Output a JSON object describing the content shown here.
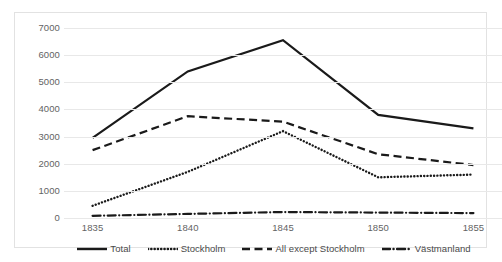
{
  "chart_data": {
    "type": "line",
    "title": "",
    "xlabel": "",
    "ylabel": "",
    "x": [
      1835,
      1840,
      1845,
      1850,
      1855
    ],
    "categories": [
      "1835",
      "1840",
      "1845",
      "1850",
      "1855"
    ],
    "xlim": [
      1833.5,
      1856.5
    ],
    "ylim": [
      0,
      7000
    ],
    "yticks": [
      0,
      1000,
      2000,
      3000,
      4000,
      5000,
      6000,
      7000
    ],
    "ytick_labels": [
      "0",
      "1000",
      "2000",
      "3000",
      "4000",
      "5000",
      "6000",
      "7000"
    ],
    "grid": true,
    "legend_position": "bottom",
    "series": [
      {
        "name": "Total",
        "style": "solid",
        "color": "#1a1a1a",
        "values": [
          2950,
          5400,
          6550,
          3800,
          3300
        ]
      },
      {
        "name": "Stockholm",
        "style": "dotted",
        "color": "#1a1a1a",
        "values": [
          450,
          1700,
          3200,
          1500,
          1600
        ]
      },
      {
        "name": "All except Stockholm",
        "style": "dashed",
        "color": "#1a1a1a",
        "values": [
          2500,
          3750,
          3550,
          2350,
          1950
        ]
      },
      {
        "name": "Västmanland",
        "style": "dash-dot",
        "color": "#1a1a1a",
        "values": [
          80,
          150,
          220,
          200,
          180
        ]
      }
    ]
  },
  "legend": {
    "items": [
      {
        "label": "Total",
        "style": "solid"
      },
      {
        "label": "Stockholm",
        "style": "dotted"
      },
      {
        "label": "All except Stockholm",
        "style": "dashed"
      },
      {
        "label": "Västmanland",
        "style": "dash-dot"
      }
    ]
  },
  "colors": {
    "series_line": "#1a1a1a",
    "gridline": "#e8e8e8",
    "frame_border": "#e2e2e2",
    "tick_text": "#636363",
    "legend_text": "#4a4a4a",
    "background": "#ffffff"
  }
}
